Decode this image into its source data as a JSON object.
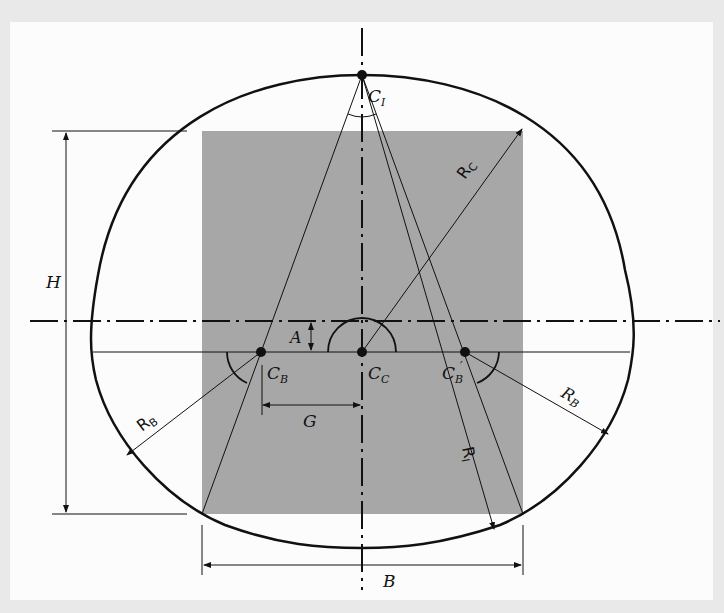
{
  "figure": {
    "background_color": "#fcfcfc",
    "fill_rect_color": "#a7a7a7",
    "line_color": "#111111"
  },
  "labels": {
    "c_i": "C",
    "c_i_sub": "I",
    "c_c": "C",
    "c_c_sub": "C",
    "c_b": "C",
    "c_b_sub": "B",
    "c_b_prime": "C",
    "c_b_prime_sub": "B",
    "c_b_prime_mark": "′",
    "r_c": "R",
    "r_c_sub": "C",
    "r_i": "R",
    "r_i_sub": "I",
    "r_b_left": "R",
    "r_b_left_sub": "B",
    "r_b_right": "R",
    "r_b_right_sub": "B",
    "h": "H",
    "a": "A",
    "g": "G",
    "b": "B"
  },
  "elements": [
    "outer-profile-curve",
    "inner-rectangle-clearance",
    "vertical-axis-centerline",
    "horizontal-axis-centerline",
    "springline",
    "center-points",
    "radius-arrows",
    "dimension-lines"
  ]
}
